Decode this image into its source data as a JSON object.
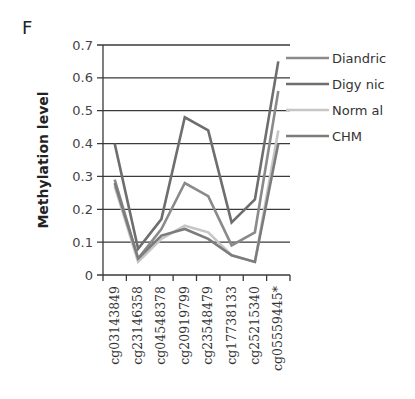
{
  "panel_label": "F",
  "chart_data": {
    "type": "line",
    "title": "",
    "xlabel": "",
    "ylabel": "Methylation level",
    "ylim": [
      0,
      0.7
    ],
    "yticks": [
      "0",
      "0.1",
      "0.2",
      "0.3",
      "0.4",
      "0.5",
      "0.6",
      "0.7"
    ],
    "grid": true,
    "legend_position": "right",
    "categories": [
      "cg03143849",
      "cg23146358",
      "cg04548378",
      "cg20919799",
      "cg23548479",
      "cg17738133",
      "cg25215340",
      "cg05559445*"
    ],
    "series": [
      {
        "name": "Diandric",
        "color": "#8a8a8a",
        "values": [
          0.29,
          0.05,
          0.14,
          0.28,
          0.24,
          0.09,
          0.13,
          0.56
        ]
      },
      {
        "name": "Digy nic",
        "color": "#6e6e6e",
        "values": [
          0.4,
          0.08,
          0.17,
          0.48,
          0.44,
          0.16,
          0.23,
          0.65
        ]
      },
      {
        "name": "Norm al",
        "color": "#c6c6c6",
        "values": [
          0.27,
          0.04,
          0.11,
          0.15,
          0.13,
          0.06,
          0.04,
          0.44
        ]
      },
      {
        "name": "CHM",
        "color": "#7c7c7c",
        "values": [
          0.28,
          0.05,
          0.12,
          0.14,
          0.11,
          0.06,
          0.04,
          0.4
        ]
      }
    ]
  }
}
